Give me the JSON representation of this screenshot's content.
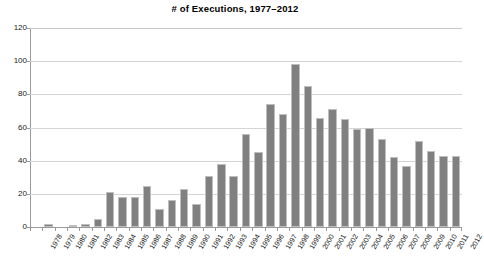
{
  "chart_data": {
    "type": "bar",
    "title": "# of Executions, 1977–2012",
    "xlabel": "",
    "ylabel": "",
    "ylim": [
      0,
      120
    ],
    "yticks": [
      0,
      20,
      40,
      60,
      80,
      100,
      120
    ],
    "grid": true,
    "legend": null,
    "bar_color": "#808080",
    "bar_border_color": "#bfbfbf",
    "gridline_color": "#d4d4d4",
    "axis_color": "#9a9a9a",
    "categories": [
      "1978",
      "1979",
      "1980",
      "1981",
      "1982",
      "1983",
      "1984",
      "1985",
      "1986",
      "1987",
      "1988",
      "1989",
      "1990",
      "1991",
      "1992",
      "1993",
      "1994",
      "1995",
      "1996",
      "1997",
      "1998",
      "1999",
      "2000",
      "2001",
      "2002",
      "2003",
      "2004",
      "2005",
      "2006",
      "2007",
      "2008",
      "2009",
      "2010",
      "2011",
      "2012"
    ],
    "values": [
      0,
      2,
      0,
      1,
      2,
      5,
      21,
      18,
      18,
      25,
      11,
      16,
      23,
      14,
      31,
      38,
      31,
      56,
      45,
      74,
      68,
      98,
      85,
      66,
      71,
      65,
      59,
      60,
      53,
      42,
      37,
      52,
      46,
      43,
      43
    ]
  }
}
